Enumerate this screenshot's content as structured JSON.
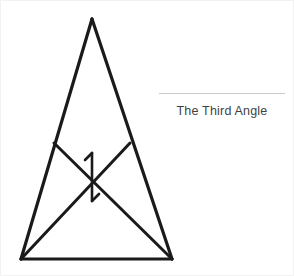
{
  "canvas": {
    "width": 294,
    "height": 276,
    "background": "#ffffff",
    "border_color": "#f2f2f2"
  },
  "caption": {
    "label": "The Third Angle",
    "text_color": "#3f3f3f",
    "rule_color": "#c9c9c9"
  },
  "diagram": {
    "name": "isosceles-triangle-with-crossing-cevians",
    "stroke_color": "#1a1a1a",
    "outer_stroke_width": 3.2,
    "inner_stroke_width": 3.0,
    "mark_stroke_width": 2.6,
    "points": {
      "apex": {
        "x": 91,
        "y": 18
      },
      "bottom_left": {
        "x": 20,
        "y": 258
      },
      "bottom_right": {
        "x": 171,
        "y": 258
      },
      "left_junction": {
        "x": 53,
        "y": 142
      },
      "right_junction": {
        "x": 129,
        "y": 142
      },
      "crossing": {
        "x": 91,
        "y": 176
      }
    },
    "edges": [
      {
        "name": "left-side",
        "from": "apex",
        "to": "bottom_left"
      },
      {
        "name": "right-side",
        "from": "apex",
        "to": "bottom_right"
      },
      {
        "name": "base",
        "from": "bottom_left",
        "to": "bottom_right"
      },
      {
        "name": "cevian-left-to-bottom-right",
        "from": "left_junction",
        "to": "bottom_right"
      },
      {
        "name": "cevian-right-to-bottom-left",
        "from": "right_junction",
        "to": "bottom_left"
      }
    ],
    "angle_mark": {
      "name": "digit-one-pair",
      "upper_label": "1",
      "lower_label": "1 (rotated 180 degrees)",
      "vertical_top": {
        "x": 91,
        "y": 152
      },
      "vertical_bottom": {
        "x": 91,
        "y": 200
      },
      "upper_flag_tip": {
        "x": 84,
        "y": 158
      },
      "lower_flag_tip": {
        "x": 98,
        "y": 194
      }
    }
  }
}
